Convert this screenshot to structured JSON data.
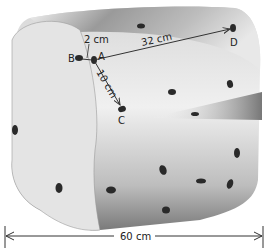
{
  "diagram": {
    "points": [
      {
        "id": "A",
        "label": "A",
        "x": 94,
        "y": 60
      },
      {
        "id": "B",
        "label": "B",
        "x": 79,
        "y": 58
      },
      {
        "id": "C",
        "label": "C",
        "x": 122,
        "y": 108
      },
      {
        "id": "D",
        "label": "D",
        "x": 233,
        "y": 28
      }
    ],
    "measurements": [
      {
        "from": "A",
        "to": "B",
        "label": "2 cm"
      },
      {
        "from": "A",
        "to": "C",
        "label": "10 cm"
      },
      {
        "from": "A",
        "to": "D",
        "label": "32 cm"
      }
    ],
    "width_dimension": {
      "label": "60 cm"
    },
    "colors": {
      "crust_dark": "#6a6a6a",
      "crumb": "#e6e6e6",
      "raisin": "#2a2a2a",
      "line": "#333333"
    }
  }
}
